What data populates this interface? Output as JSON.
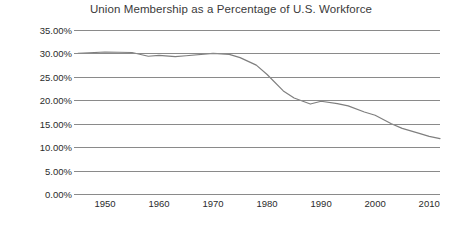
{
  "chart_data": {
    "type": "line",
    "title": "Union Membership as a Percentage of U.S. Workforce",
    "xlabel": "",
    "ylabel": "",
    "xlim": [
      1945,
      2012
    ],
    "ylim": [
      0,
      35
    ],
    "grid": true,
    "legend": "none",
    "line_color": "#7f7f7f",
    "grid_color": "#8a8a8a",
    "text_color": "#2b2b2b",
    "title_color": "#3a3a3a",
    "yticks": [
      "0.00%",
      "5.00%",
      "10.00%",
      "15.00%",
      "20.00%",
      "25.00%",
      "30.00%",
      "35.00%"
    ],
    "ytick_values": [
      0,
      5,
      10,
      15,
      20,
      25,
      30,
      35
    ],
    "xticks": [
      "1950",
      "1960",
      "1970",
      "1980",
      "1990",
      "2000",
      "2010"
    ],
    "xtick_values": [
      1950,
      1960,
      1970,
      1980,
      1990,
      2000,
      2010
    ],
    "series": [
      {
        "name": "Union Membership",
        "x": [
          1945,
          1950,
          1955,
          1958,
          1960,
          1963,
          1965,
          1970,
          1973,
          1975,
          1978,
          1980,
          1983,
          1985,
          1988,
          1990,
          1993,
          1995,
          1998,
          2000,
          2003,
          2005,
          2008,
          2010,
          2012
        ],
        "values": [
          30.0,
          30.3,
          30.2,
          29.4,
          29.6,
          29.3,
          29.5,
          30.0,
          29.8,
          29.1,
          27.5,
          25.5,
          22.0,
          20.5,
          19.2,
          19.8,
          19.3,
          18.8,
          17.5,
          16.8,
          15.0,
          14.0,
          13.0,
          12.3,
          11.8
        ]
      }
    ]
  }
}
